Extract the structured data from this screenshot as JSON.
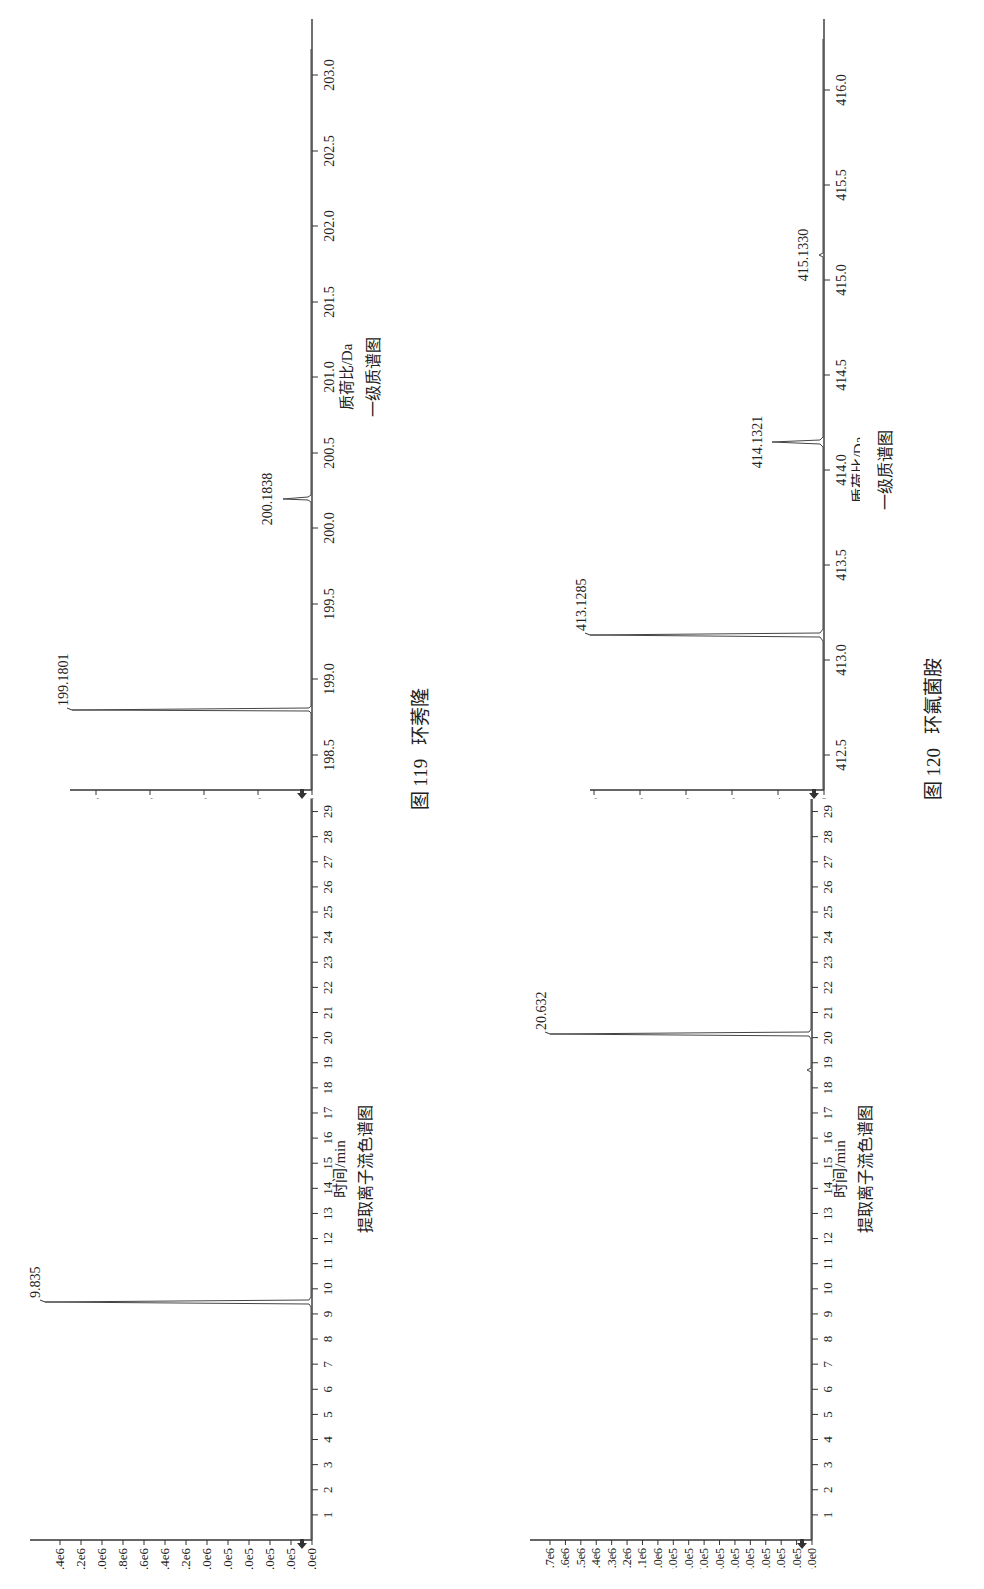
{
  "figures": [
    {
      "number_label": "图 119",
      "compound": "环莠隆",
      "chromatogram": {
        "xlabel": "时间/min",
        "subtitle": "提取离子流色谱图",
        "peak_label": "9.835"
      },
      "spectrum": {
        "xlabel": "质荷比/Da",
        "subtitle": "一级质谱图",
        "peak_labels": [
          "199.1801",
          "200.1838"
        ]
      }
    },
    {
      "number_label": "图 120",
      "compound": "环氟菌胺",
      "chromatogram": {
        "xlabel": "时间/min",
        "subtitle": "提取离子流色谱图",
        "peak_label": "20.632"
      },
      "spectrum": {
        "xlabel": "质荷比/Da",
        "subtitle": "一级质谱图",
        "peak_labels": [
          "413.1285",
          "414.1321",
          "415.1330"
        ]
      }
    }
  ],
  "chart_data": [
    {
      "type": "line",
      "title": "图 119 环莠隆 — 提取离子流色谱图",
      "xlabel": "时间/min",
      "ylabel": "",
      "x_ticks": [
        "1",
        "2",
        "3",
        "4",
        "5",
        "6",
        "7",
        "8",
        "9",
        "10",
        "11",
        "12",
        "13",
        "14",
        "15",
        "16",
        "17",
        "18",
        "19",
        "20",
        "21",
        "22",
        "23",
        "24",
        "25",
        "26",
        "27",
        "28",
        "29"
      ],
      "y_ticks": [
        "0.0e0",
        "2.0e5",
        "4.0e5",
        "6.0e5",
        "8.0e5",
        "1.0e6",
        "1.2e6",
        "1.4e6",
        "1.6e6",
        "1.8e6",
        "2.0e6",
        "2.2e6",
        "2.4e6"
      ],
      "xlim": [
        0,
        29.5
      ],
      "ylim": [
        0,
        2550000.0
      ],
      "peaks": [
        {
          "x": 9.835,
          "y": 2450000.0,
          "label": "9.835"
        }
      ],
      "grid": false
    },
    {
      "type": "bar",
      "title": "图 119 环莠隆 — 一级质谱图",
      "xlabel": "质荷比/Da",
      "ylabel": "",
      "x_ticks": [
        "198.5",
        "199.0",
        "199.5",
        "200.0",
        "200.5",
        "201.0",
        "201.5",
        "202.0",
        "202.5",
        "203.0"
      ],
      "y_ticks": [
        "0e0",
        "1e5",
        "2e5",
        "3e5",
        "4e5"
      ],
      "xlim": [
        198.3,
        203.3
      ],
      "ylim": [
        0,
        450000.0
      ],
      "peaks": [
        {
          "x": 199.1801,
          "y": 440000.0,
          "label": "199.1801"
        },
        {
          "x": 200.1838,
          "y": 55000.0,
          "label": "200.1838"
        },
        {
          "x": 201.19,
          "y": 4000.0,
          "label": ""
        }
      ],
      "grid": false
    },
    {
      "type": "line",
      "title": "图 120 环氟菌胺 — 提取离子流色谱图",
      "xlabel": "时间/min",
      "ylabel": "",
      "x_ticks": [
        "1",
        "2",
        "3",
        "4",
        "5",
        "6",
        "7",
        "8",
        "9",
        "10",
        "11",
        "12",
        "13",
        "14",
        "15",
        "16",
        "17",
        "18",
        "19",
        "20",
        "21",
        "22",
        "23",
        "24",
        "25",
        "26",
        "27",
        "28",
        "29"
      ],
      "y_ticks": [
        "0.0e0",
        "1.0e5",
        "2.0e5",
        "3.0e5",
        "4.0e5",
        "5.0e5",
        "6.0e5",
        "7.0e5",
        "8.0e5",
        "9.0e5",
        "1.0e6",
        "1.1e6",
        "1.2e6",
        "1.3e6",
        "1.4e6",
        "1.5e6",
        "1.6e6",
        "1.7e6"
      ],
      "xlim": [
        0,
        29.5
      ],
      "ylim": [
        0,
        1750000.0
      ],
      "peaks": [
        {
          "x": 20.632,
          "y": 1730000.0,
          "label": "20.632"
        },
        {
          "x": 19.1,
          "y": 50000.0,
          "label": ""
        }
      ],
      "grid": false
    },
    {
      "type": "bar",
      "title": "图 120 环氟菌胺 — 一级质谱图",
      "xlabel": "质荷比/Da",
      "ylabel": "",
      "x_ticks": [
        "412.5",
        "413.0",
        "413.5",
        "414.0",
        "414.5",
        "415.0",
        "415.5",
        "416.0"
      ],
      "y_ticks": [
        "0.0e0",
        "5.0e4",
        "1.0e5",
        "1.5e5",
        "2.0e5",
        "2.5e5"
      ],
      "xlim": [
        412.3,
        416.3
      ],
      "ylim": [
        0,
        260000.0
      ],
      "peaks": [
        {
          "x": 413.1285,
          "y": 255000.0,
          "label": "413.1285"
        },
        {
          "x": 414.1321,
          "y": 55000.0,
          "label": "414.1321"
        },
        {
          "x": 415.133,
          "y": 2000.0,
          "label": "415.1330"
        }
      ],
      "grid": false
    }
  ]
}
